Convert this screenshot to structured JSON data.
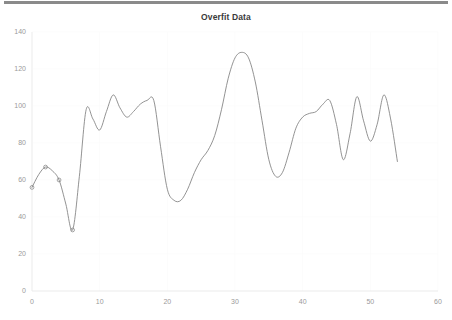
{
  "chart_data": {
    "type": "line",
    "title": "Overfit Data",
    "xlabel": "",
    "ylabel": "",
    "xlim": [
      0,
      60
    ],
    "ylim": [
      0,
      140
    ],
    "grid": true,
    "legend": null,
    "legend_position": "none",
    "line_color": "#7f7f7f",
    "marker_color": "#7f7f7f",
    "xticks": [
      0,
      10,
      20,
      30,
      40,
      50,
      60
    ],
    "yticks": [
      0,
      20,
      40,
      60,
      80,
      100,
      120,
      140
    ],
    "markers_x": [
      0,
      2,
      4,
      6
    ],
    "markers_y": [
      56,
      67,
      60,
      33
    ],
    "x": [
      0,
      1,
      2,
      3,
      4,
      5,
      6,
      7,
      8,
      9,
      10,
      11,
      12,
      13,
      14,
      15,
      16,
      17,
      18,
      19,
      20,
      21,
      22,
      23,
      24,
      25,
      26,
      27,
      28,
      29,
      30,
      31,
      32,
      33,
      34,
      35,
      36,
      37,
      38,
      39,
      40,
      41,
      42,
      43,
      44,
      45,
      46,
      47,
      48,
      49,
      50,
      51,
      52,
      53,
      54
    ],
    "y": [
      56,
      63,
      67,
      65,
      60,
      47,
      33,
      62,
      98,
      93,
      87,
      97,
      106,
      99,
      94,
      97,
      101,
      103,
      103,
      78,
      55,
      49,
      49,
      55,
      64,
      71,
      76,
      84,
      98,
      115,
      126,
      129,
      126,
      113,
      92,
      71,
      62,
      64,
      75,
      88,
      94,
      96,
      97,
      101,
      103,
      90,
      71,
      85,
      105,
      92,
      81,
      90,
      106,
      93,
      70
    ]
  },
  "axis": {
    "y_labels": [
      "140",
      "120",
      "100",
      "80",
      "60",
      "40",
      "20",
      "0"
    ],
    "x_labels": [
      "0",
      "10",
      "20",
      "30",
      "40",
      "50",
      "60"
    ]
  },
  "icons": {
    "top_rule": "horizontal-rule"
  }
}
